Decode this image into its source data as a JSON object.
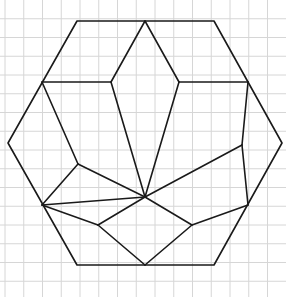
{
  "figure": {
    "description": "Hexagon on square grid paper subdivided into polygons radiating from an interior point",
    "width": 286,
    "height": 297,
    "grid": {
      "spacing": 18.75,
      "offset_x": 5,
      "offset_y": 0,
      "color": "#d6d6d6"
    },
    "line_color": "#1a1a1a",
    "background": "#ffffff",
    "hexagon": [
      [
        77,
        21
      ],
      [
        214,
        21
      ],
      [
        282,
        143
      ],
      [
        214,
        265
      ],
      [
        77,
        265
      ],
      [
        8,
        143
      ]
    ],
    "segments": [
      [
        [
          145,
          21
        ],
        [
          111,
          82
        ]
      ],
      [
        [
          145,
          21
        ],
        [
          179,
          82
        ]
      ],
      [
        [
          42,
          82
        ],
        [
          111,
          82
        ]
      ],
      [
        [
          179,
          82
        ],
        [
          248,
          82
        ]
      ],
      [
        [
          111,
          82
        ],
        [
          145,
          197
        ]
      ],
      [
        [
          179,
          82
        ],
        [
          145,
          197
        ]
      ],
      [
        [
          42,
          82
        ],
        [
          78,
          164
        ]
      ],
      [
        [
          248,
          82
        ],
        [
          242,
          145
        ]
      ],
      [
        [
          78,
          164
        ],
        [
          145,
          197
        ]
      ],
      [
        [
          242,
          145
        ],
        [
          145,
          197
        ]
      ],
      [
        [
          78,
          164
        ],
        [
          42,
          205
        ]
      ],
      [
        [
          242,
          145
        ],
        [
          248,
          205
        ]
      ],
      [
        [
          42,
          205
        ],
        [
          145,
          197
        ]
      ],
      [
        [
          42,
          205
        ],
        [
          98,
          225
        ]
      ],
      [
        [
          98,
          225
        ],
        [
          145,
          197
        ]
      ],
      [
        [
          145,
          197
        ],
        [
          192,
          225
        ]
      ],
      [
        [
          192,
          225
        ],
        [
          248,
          205
        ]
      ],
      [
        [
          98,
          225
        ],
        [
          145,
          265
        ]
      ],
      [
        [
          192,
          225
        ],
        [
          145,
          265
        ]
      ]
    ]
  }
}
